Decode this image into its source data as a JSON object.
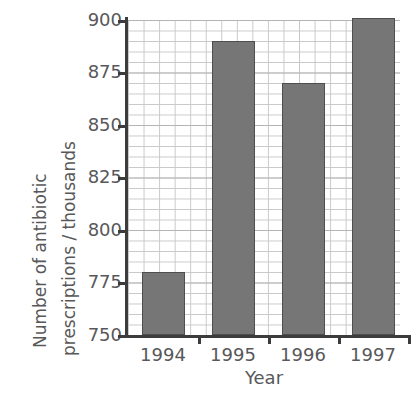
{
  "chart_data": {
    "type": "bar",
    "title": "",
    "xlabel": "Year",
    "ylabel": "Number of antibiotic prescriptions / thousands",
    "ylabel_lines": [
      "Number of antibiotic",
      "prescriptions / thousands"
    ],
    "categories": [
      "1994",
      "1995",
      "1996",
      "1997"
    ],
    "values": [
      780,
      890,
      870,
      901
    ],
    "ylim": [
      750,
      900
    ],
    "ytick_labels": [
      "750",
      "775",
      "800",
      "825",
      "850",
      "875",
      "900"
    ],
    "ytick_values": [
      750,
      775,
      800,
      825,
      850,
      875,
      900
    ],
    "ymajor_step": 25,
    "yminor_step": 5,
    "grid": true,
    "legend": "none",
    "series": [
      {
        "name": "Antibiotic prescriptions",
        "values": [
          780,
          890,
          870,
          901
        ]
      }
    ],
    "colors": {
      "bar_fill": "#767676",
      "bar_stroke": "#4e4e4e",
      "gridline": "#c9c9c9",
      "major_gridline": "#b4b4b4",
      "axis": "#3c3c3c",
      "text": "#58585a",
      "background": "#ffffff"
    }
  }
}
